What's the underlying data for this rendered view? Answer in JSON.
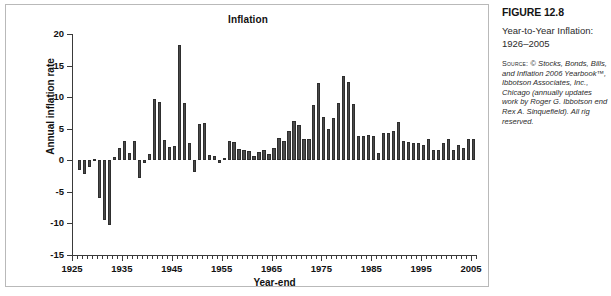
{
  "figure": {
    "number": "FIGURE 12.8",
    "title": "Year-to-Year Inflation: 1926–2005",
    "source_label": "Source:",
    "source_text": " © Stocks, Bonds, Bills, and Inflation 2006 Yearbook™, Ibbotson Associates, Inc., Chicago (annually updates work by Roger G. Ibbotson end Rex A. Sinquefield). All rig reserved."
  },
  "chart_data": {
    "type": "bar",
    "title": "Inflation",
    "xlabel": "Year-end",
    "ylabel": "Annual inflation rate",
    "ylim": [
      -15,
      20
    ],
    "yticks": [
      20,
      15,
      10,
      5,
      0,
      -5,
      -10,
      -15
    ],
    "xlim": [
      1925,
      2006
    ],
    "xticks": [
      1925,
      1935,
      1945,
      1955,
      1965,
      1975,
      1985,
      1995,
      2005
    ],
    "grid": false,
    "legend": "none",
    "bar_color": "#4a4a4a",
    "categories": [
      1926,
      1927,
      1928,
      1929,
      1930,
      1931,
      1932,
      1933,
      1934,
      1935,
      1936,
      1937,
      1938,
      1939,
      1940,
      1941,
      1942,
      1943,
      1944,
      1945,
      1946,
      1947,
      1948,
      1949,
      1950,
      1951,
      1952,
      1953,
      1954,
      1955,
      1956,
      1957,
      1958,
      1959,
      1960,
      1961,
      1962,
      1963,
      1964,
      1965,
      1966,
      1967,
      1968,
      1969,
      1970,
      1971,
      1972,
      1973,
      1974,
      1975,
      1976,
      1977,
      1978,
      1979,
      1980,
      1981,
      1982,
      1983,
      1984,
      1985,
      1986,
      1987,
      1988,
      1989,
      1990,
      1991,
      1992,
      1993,
      1994,
      1995,
      1996,
      1997,
      1998,
      1999,
      2000,
      2001,
      2002,
      2003,
      2004,
      2005
    ],
    "values": [
      -1.5,
      -2.1,
      -1.0,
      0.2,
      -6.0,
      -9.5,
      -10.3,
      0.5,
      2.0,
      3.0,
      1.2,
      3.1,
      -2.8,
      -0.5,
      1.0,
      9.7,
      9.3,
      3.2,
      2.1,
      2.3,
      18.2,
      9.0,
      2.7,
      -1.8,
      5.8,
      5.9,
      0.9,
      0.6,
      -0.5,
      0.4,
      3.0,
      2.9,
      1.8,
      1.7,
      1.4,
      0.7,
      1.3,
      1.6,
      1.0,
      1.9,
      3.5,
      3.0,
      4.7,
      6.2,
      5.6,
      3.3,
      3.4,
      8.7,
      12.3,
      6.9,
      4.9,
      6.7,
      9.0,
      13.3,
      12.4,
      8.9,
      3.9,
      3.8,
      4.0,
      3.8,
      1.1,
      4.4,
      4.4,
      4.6,
      6.1,
      3.1,
      2.9,
      2.7,
      2.7,
      2.5,
      3.3,
      1.7,
      1.6,
      2.7,
      3.4,
      1.6,
      2.4,
      1.9,
      3.3,
      3.4
    ]
  }
}
